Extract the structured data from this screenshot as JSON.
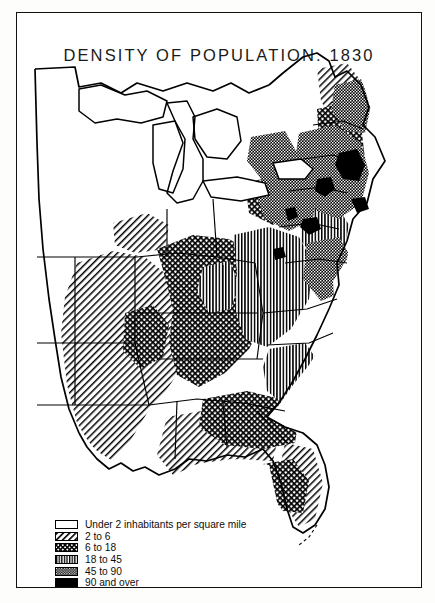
{
  "map": {
    "title": "DENSITY OF POPULATION. 1830",
    "region": "Eastern United States",
    "year": "1830"
  },
  "legend": {
    "items": [
      {
        "label": "Under 2 inhabitants per square mile",
        "pattern": "blank",
        "class_index": 0
      },
      {
        "label": "2 to 6",
        "pattern": "diagonal-hatch",
        "class_index": 1
      },
      {
        "label": "6 to 18",
        "pattern": "cross-hatch",
        "class_index": 2
      },
      {
        "label": "18 to 45",
        "pattern": "vertical-lines",
        "class_index": 3
      },
      {
        "label": "45 to 90",
        "pattern": "dense-stipple",
        "class_index": 4
      },
      {
        "label": "90 and over",
        "pattern": "solid-black",
        "class_index": 5
      }
    ]
  },
  "colors": {
    "ink": "#000000",
    "paper": "#ffffff",
    "frame": "#111111"
  }
}
